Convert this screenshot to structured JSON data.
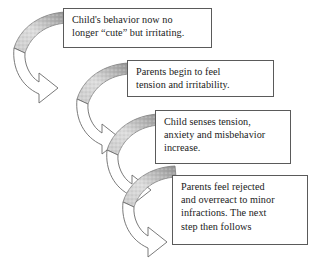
{
  "diagram": {
    "colors": {
      "background": "#ffffff",
      "box_border": "#5a5a5a",
      "text": "#1a1a1a",
      "arrow_outline": "#6b6b6b",
      "arrow_shade_light": "#d8d8d8",
      "arrow_shade_dark": "#9a9a9a"
    },
    "steps": [
      {
        "id": "step-1",
        "order": 1,
        "text": "Child's behavior now no\nlonger “cute”  but irritating."
      },
      {
        "id": "step-2",
        "order": 2,
        "text": "Parents begin to feel\ntension and irritability."
      },
      {
        "id": "step-3",
        "order": 3,
        "text": "Child senses tension,\nanxiety and misbehavior\nincrease."
      },
      {
        "id": "step-4",
        "order": 4,
        "text": "Parents feel rejected\nand overreact to minor\ninfractions. The next\nstep then follows"
      }
    ],
    "connectors": [
      {
        "id": "connector-1",
        "from": "step-1",
        "to": "step-2",
        "shape": "curved-u-turn-arrow"
      },
      {
        "id": "connector-2",
        "from": "step-2",
        "to": "step-3",
        "shape": "curved-u-turn-arrow"
      },
      {
        "id": "connector-3",
        "from": "step-3",
        "to": "step-4",
        "shape": "curved-u-turn-arrow"
      },
      {
        "id": "connector-4",
        "from": "step-4",
        "to": "step-1",
        "shape": "curved-u-turn-arrow"
      }
    ]
  }
}
